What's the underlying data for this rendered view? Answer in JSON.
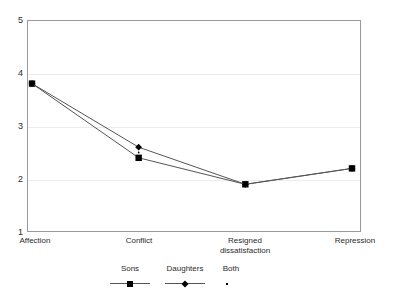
{
  "chart_data": {
    "type": "line",
    "title": "",
    "subtitle": "",
    "xlabel": "",
    "ylabel": "",
    "categories": [
      "Affection",
      "Conflict",
      "Resigned\ndissatisfaction",
      "Repression"
    ],
    "category_labels_flat": [
      "Affection",
      "Conflict",
      "Resigned dissatisfaction",
      "Repression"
    ],
    "yticks": [
      "5",
      "4",
      "3",
      "2",
      "1"
    ],
    "ytick_values": [
      5,
      4,
      3,
      2,
      1
    ],
    "ylim": [
      1,
      5
    ],
    "grid": "horizontal",
    "legend_position": "bottom",
    "series": [
      {
        "name": "Sons",
        "marker": "square",
        "values": [
          3.8,
          2.4,
          1.9,
          2.2
        ]
      },
      {
        "name": "Daughters",
        "marker": "diamond",
        "values": [
          3.8,
          2.6,
          1.9,
          2.2
        ]
      },
      {
        "name": "Both",
        "marker": "dot",
        "values": [
          3.8,
          2.5,
          1.9,
          2.2
        ]
      }
    ],
    "colors": {
      "line": "#555555",
      "marker": "#000000",
      "grid": "#ececec",
      "axis": "#9a9a9a",
      "background": "#ffffff",
      "text": "#2b2b2b"
    }
  },
  "legend": {
    "items": [
      {
        "label": "Sons",
        "marker": "square-marker-icon",
        "has_line": true
      },
      {
        "label": "Daughters",
        "marker": "diamond-marker-icon",
        "has_line": true
      },
      {
        "label": "Both",
        "marker": "dot-marker-icon",
        "has_line": false
      }
    ]
  }
}
